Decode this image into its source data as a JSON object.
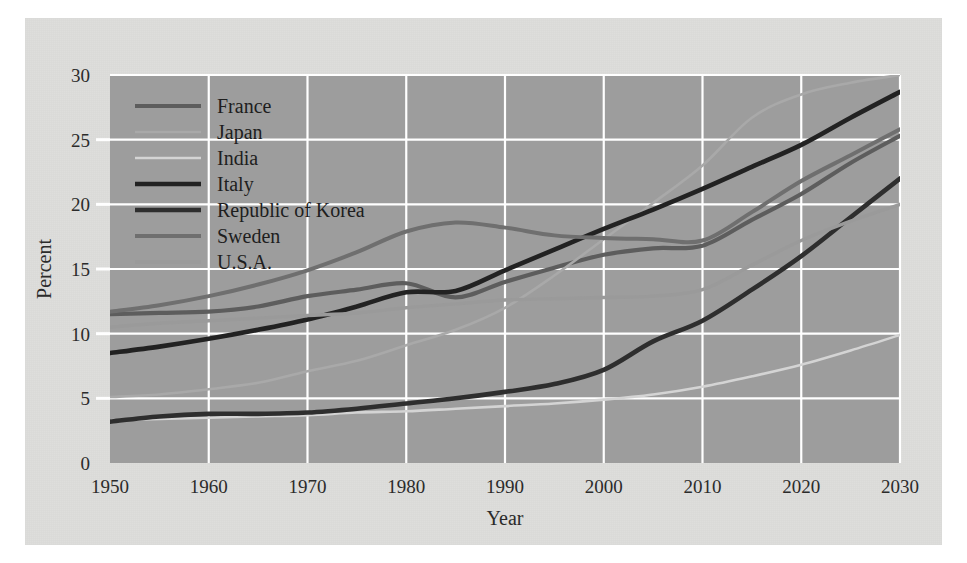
{
  "chart_data": {
    "type": "line",
    "title": "",
    "xlabel": "Year",
    "ylabel": "Percent",
    "xlim": [
      1950,
      2030
    ],
    "ylim": [
      0,
      30
    ],
    "xticks": [
      "1950",
      "1960",
      "1970",
      "1980",
      "1990",
      "2000",
      "2010",
      "2020",
      "2030"
    ],
    "yticks": [
      "0",
      "5",
      "10",
      "15",
      "20",
      "25",
      "30"
    ],
    "grid": true,
    "legend_position": "upper-left-inside",
    "x": [
      1950,
      1955,
      1960,
      1965,
      1970,
      1975,
      1980,
      1985,
      1990,
      1995,
      2000,
      2005,
      2010,
      2015,
      2020,
      2025,
      2030
    ],
    "series": [
      {
        "name": "France",
        "color": "#5d5d5d",
        "width": 4.2,
        "values": [
          11.5,
          11.6,
          11.7,
          12.1,
          12.9,
          13.4,
          13.9,
          12.8,
          14.0,
          15.1,
          16.1,
          16.6,
          16.8,
          18.8,
          20.8,
          23.2,
          25.3
        ]
      },
      {
        "name": "Japan",
        "color": "#a9a9a9",
        "width": 2.6,
        "values": [
          5.1,
          5.3,
          5.7,
          6.2,
          7.1,
          7.9,
          9.1,
          10.3,
          12.0,
          14.5,
          17.3,
          20.1,
          23.0,
          26.7,
          28.5,
          29.4,
          30.0
        ]
      },
      {
        "name": "India",
        "color": "#d4d4d4",
        "width": 2.6,
        "values": [
          3.3,
          3.4,
          3.5,
          3.6,
          3.7,
          3.9,
          4.0,
          4.2,
          4.4,
          4.6,
          4.9,
          5.3,
          5.9,
          6.7,
          7.6,
          8.7,
          9.9
        ]
      },
      {
        "name": "Italy",
        "color": "#222222",
        "width": 4.6,
        "values": [
          8.5,
          9.0,
          9.6,
          10.3,
          11.1,
          12.1,
          13.2,
          13.3,
          14.9,
          16.5,
          18.1,
          19.6,
          21.2,
          22.9,
          24.6,
          26.7,
          28.7
        ]
      },
      {
        "name": "Republic of Korea",
        "color": "#2e2e2e",
        "width": 4.6,
        "values": [
          3.2,
          3.6,
          3.8,
          3.8,
          3.9,
          4.2,
          4.6,
          5.0,
          5.5,
          6.1,
          7.2,
          9.4,
          11.0,
          13.4,
          16.0,
          19.0,
          22.0
        ]
      },
      {
        "name": "Sweden",
        "color": "#6f6f6f",
        "width": 4.0,
        "values": [
          11.7,
          12.2,
          12.9,
          13.8,
          14.9,
          16.3,
          17.9,
          18.6,
          18.2,
          17.6,
          17.4,
          17.3,
          17.2,
          19.4,
          21.8,
          23.8,
          25.8
        ]
      },
      {
        "name": "U.S.A.",
        "color": "#9a9a9a",
        "width": 3.4,
        "values": [
          10.5,
          10.8,
          11.0,
          11.2,
          11.4,
          11.6,
          12.0,
          12.3,
          12.6,
          12.7,
          12.8,
          12.9,
          13.4,
          15.3,
          17.2,
          18.7,
          20.0
        ]
      }
    ]
  },
  "figure": {
    "page_background": "#dededc",
    "plot_background": "#9d9d9d",
    "grid_color": "#ffffff",
    "tick_color": "#ffffff",
    "text_color": "#2b2b2b"
  }
}
